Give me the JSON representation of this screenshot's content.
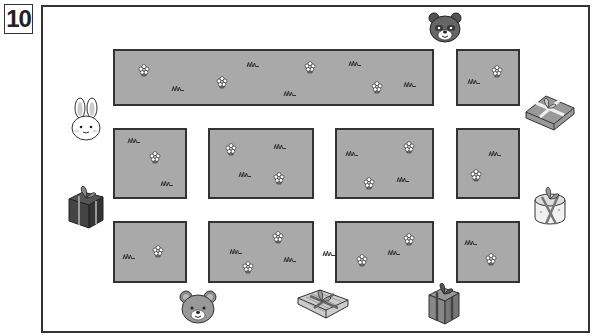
{
  "puzzle": {
    "number": "10",
    "colors": {
      "block_fill": "#a9a9a9",
      "block_border": "#333333",
      "background": "#ffffff"
    }
  },
  "blocks": [
    {
      "id": "top-wide",
      "x": 113,
      "y": 49,
      "w": 321,
      "h": 57
    },
    {
      "id": "top-right",
      "x": 456,
      "y": 49,
      "w": 64,
      "h": 57
    },
    {
      "id": "mid-1",
      "x": 113,
      "y": 128,
      "w": 74,
      "h": 71
    },
    {
      "id": "mid-2",
      "x": 208,
      "y": 128,
      "w": 106,
      "h": 71
    },
    {
      "id": "mid-3",
      "x": 335,
      "y": 128,
      "w": 99,
      "h": 71
    },
    {
      "id": "mid-4",
      "x": 456,
      "y": 128,
      "w": 64,
      "h": 71
    },
    {
      "id": "bot-1",
      "x": 113,
      "y": 221,
      "w": 74,
      "h": 62
    },
    {
      "id": "bot-2",
      "x": 208,
      "y": 221,
      "w": 106,
      "h": 62
    },
    {
      "id": "bot-3",
      "x": 335,
      "y": 221,
      "w": 99,
      "h": 62
    },
    {
      "id": "bot-4",
      "x": 456,
      "y": 221,
      "w": 64,
      "h": 62
    }
  ],
  "flowers": [
    [
      144,
      70
    ],
    [
      222,
      82
    ],
    [
      310,
      67
    ],
    [
      377,
      87
    ],
    [
      497,
      71
    ],
    [
      155,
      157
    ],
    [
      231,
      149
    ],
    [
      279,
      178
    ],
    [
      409,
      147
    ],
    [
      369,
      183
    ],
    [
      476,
      175
    ],
    [
      158,
      251
    ],
    [
      278,
      237
    ],
    [
      248,
      267
    ],
    [
      409,
      239
    ],
    [
      362,
      260
    ],
    [
      491,
      259
    ]
  ],
  "grass": [
    [
      178,
      88
    ],
    [
      253,
      64
    ],
    [
      290,
      93
    ],
    [
      355,
      63
    ],
    [
      410,
      84
    ],
    [
      474,
      81
    ],
    [
      134,
      140
    ],
    [
      167,
      183
    ],
    [
      280,
      146
    ],
    [
      245,
      174
    ],
    [
      352,
      153
    ],
    [
      403,
      179
    ],
    [
      495,
      153
    ],
    [
      129,
      256
    ],
    [
      236,
      251
    ],
    [
      290,
      259
    ],
    [
      329,
      253
    ],
    [
      394,
      252
    ],
    [
      471,
      242
    ]
  ],
  "characters": [
    {
      "name": "raccoon",
      "x": 445,
      "y": 27
    },
    {
      "name": "rabbit",
      "x": 86,
      "y": 119
    },
    {
      "name": "bear",
      "x": 198,
      "y": 307
    }
  ],
  "gifts": [
    {
      "name": "gift-flat-right",
      "x": 550,
      "y": 114
    },
    {
      "name": "gift-dark-left",
      "x": 86,
      "y": 207
    },
    {
      "name": "gift-round-right",
      "x": 550,
      "y": 205
    },
    {
      "name": "gift-flat-bottom",
      "x": 323,
      "y": 305
    },
    {
      "name": "gift-box-bottom",
      "x": 444,
      "y": 304
    }
  ]
}
